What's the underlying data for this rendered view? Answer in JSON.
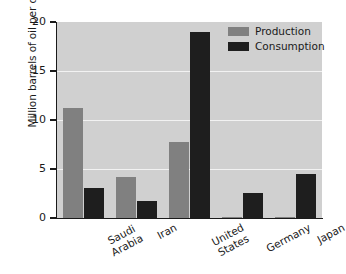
{
  "chart_data": {
    "type": "bar",
    "title": "",
    "xlabel": "",
    "ylabel": "Million barrels of oil per day",
    "ylim": [
      0,
      20
    ],
    "yticks": [
      0,
      5,
      10,
      15,
      20
    ],
    "ytick_labels": [
      "0",
      "5",
      "10",
      "15",
      "20"
    ],
    "grid": true,
    "grid_axis": "y",
    "legend_position": "top-right",
    "categories": [
      "Saudi Arabia",
      "Iran",
      "United States",
      "Germany",
      "Japan"
    ],
    "category_label_lines": [
      [
        "Saudi",
        "Arabia"
      ],
      [
        "Iran"
      ],
      [
        "United",
        "States"
      ],
      [
        "Germany"
      ],
      [
        "Japan"
      ]
    ],
    "series": [
      {
        "name": "Production",
        "color": "#808080",
        "values": [
          11.2,
          4.2,
          7.8,
          0.15,
          0.05
        ]
      },
      {
        "name": "Consumption",
        "color": "#1e1e1e",
        "values": [
          3.1,
          1.7,
          19.0,
          2.6,
          4.5
        ]
      }
    ]
  },
  "style": {
    "plot_background": "#d0d0d0",
    "figure_background": "#ffffff",
    "gridline_color": "#f2f2f2",
    "axis_color": "#1a1a1a",
    "text_color": "#1a1a1a"
  },
  "legend": {
    "items": [
      {
        "label": "Production",
        "color": "#808080"
      },
      {
        "label": "Consumption",
        "color": "#1e1e1e"
      }
    ]
  }
}
